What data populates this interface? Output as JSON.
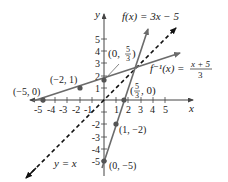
{
  "figure": {
    "type": "function-and-inverse-graph",
    "axes": {
      "x_label": "x",
      "y_label": "y",
      "x_ticks": [
        "-5",
        "-4",
        "-3",
        "-2",
        "-1",
        "1",
        "2",
        "3",
        "4",
        "5"
      ],
      "y_ticks": [
        "5",
        "4",
        "3",
        "2",
        "1",
        "-2",
        "-3",
        "-4",
        "-5"
      ],
      "xlim": [
        -6,
        6
      ],
      "ylim": [
        -5.5,
        6
      ]
    },
    "curves": [
      {
        "name": "f",
        "label": "f(x) = 3x − 5",
        "style": "solid",
        "color": "#6b6b6b"
      },
      {
        "name": "f_inverse",
        "label_left": "f⁻¹(x) = ",
        "label_num": "x + 5",
        "label_den": "3",
        "style": "solid",
        "color": "#6b6b6b"
      },
      {
        "name": "identity",
        "label": "y = x",
        "style": "dashed",
        "color": "#111111"
      }
    ],
    "points": [
      {
        "label": "(−5, 0)",
        "x": -5,
        "y": 0
      },
      {
        "label": "(−2, 1)",
        "x": -2,
        "y": 1
      },
      {
        "label_prefix": "(0, ",
        "label_num": "5",
        "label_den": "3",
        "label_suffix": ")",
        "x": 0,
        "y": 1.667
      },
      {
        "label_prefix": "(",
        "label_num": "5",
        "label_den": "3",
        "label_suffix": ", 0)",
        "x": 1.667,
        "y": 0
      },
      {
        "label": "(1, −2)",
        "x": 1,
        "y": -2
      },
      {
        "label": "(0, −5)",
        "x": 0,
        "y": -5
      }
    ]
  }
}
